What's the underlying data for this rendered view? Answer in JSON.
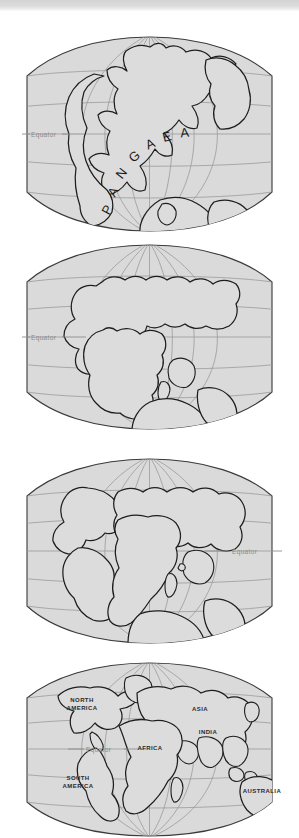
{
  "figure": {
    "type": "continental-drift-sequence",
    "panel_count": 4,
    "colors": {
      "globe_fill": "#dadada",
      "land_fill": "#dcdcdc",
      "coast_stroke": "#1e1e1e",
      "grid_stroke": "#9a9a9a",
      "label_gray": "#8a8a8a",
      "page_background": "#ffffff",
      "scan_strip": "#d4d4d4"
    }
  },
  "panels": [
    {
      "id": "panel-1",
      "stage_name": "Pangaea",
      "equator_label": "Equator",
      "equator_label_side": "left",
      "supercontinent_label": "PANGAEA",
      "supercontinent_letters": [
        "P",
        "A",
        "N",
        "G",
        "A",
        "E",
        "A"
      ],
      "continent_labels": []
    },
    {
      "id": "panel-2",
      "stage_name": "Early breakup",
      "equator_label": "Equator",
      "equator_label_side": "left",
      "supercontinent_label": "",
      "supercontinent_letters": [],
      "continent_labels": []
    },
    {
      "id": "panel-3",
      "stage_name": "Continued separation",
      "equator_label": "Equator",
      "equator_label_side": "right",
      "supercontinent_label": "",
      "supercontinent_letters": [],
      "continent_labels": []
    },
    {
      "id": "panel-4",
      "stage_name": "Present day",
      "equator_label": "Equator",
      "equator_label_side": "interior",
      "supercontinent_label": "",
      "supercontinent_letters": [],
      "continent_labels": [
        {
          "name": "NORTH AMERICA",
          "line1": "NORTH",
          "line2": "AMERICA"
        },
        {
          "name": "ASIA",
          "line1": "ASIA",
          "line2": ""
        },
        {
          "name": "INDIA",
          "line1": "INDIA",
          "line2": ""
        },
        {
          "name": "AFRICA",
          "line1": "AFRICA",
          "line2": ""
        },
        {
          "name": "SOUTH AMERICA",
          "line1": "SOUTH",
          "line2": "AMERICA"
        },
        {
          "name": "AUSTRALIA",
          "line1": "AUSTRALIA",
          "line2": ""
        }
      ]
    }
  ]
}
